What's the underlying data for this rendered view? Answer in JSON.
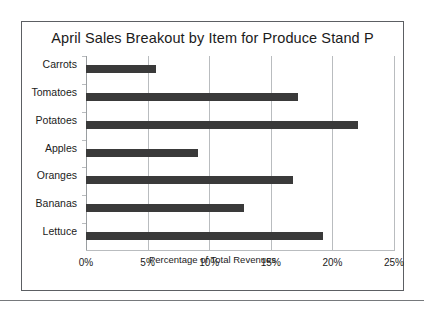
{
  "chart_data": {
    "type": "bar",
    "orientation": "horizontal",
    "title": "April Sales Breakout by Item for Produce Stand P",
    "xlabel": "Percentage of Total Revenues",
    "ylabel": "",
    "categories": [
      "Carrots",
      "Tomatoes",
      "Potatoes",
      "Apples",
      "Oranges",
      "Bananas",
      "Lettuce"
    ],
    "values": [
      5.7,
      17.2,
      22.1,
      9.1,
      16.8,
      12.8,
      19.2
    ],
    "xlim": [
      0,
      25
    ],
    "xticks": [
      0,
      5,
      10,
      15,
      20,
      25
    ],
    "xtick_labels": [
      "0%",
      "5%",
      "10%",
      "15%",
      "20%",
      "25%"
    ],
    "grid": "vertical",
    "legend": "none",
    "bar_color": "#3a3a3a",
    "grid_color": "#b9bcbf",
    "frame_color": "#5c5f63",
    "background": "#ffffff"
  }
}
